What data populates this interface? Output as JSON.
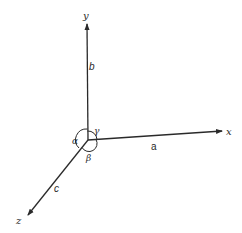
{
  "diagram": {
    "axes": [
      {
        "name": "x",
        "label": "x",
        "edge_label": "a"
      },
      {
        "name": "y",
        "label": "y",
        "edge_label": "b"
      },
      {
        "name": "z",
        "label": "z",
        "edge_label": "c"
      }
    ],
    "angles": [
      {
        "name": "alpha",
        "symbol": "α"
      },
      {
        "name": "beta",
        "symbol": "β"
      },
      {
        "name": "gamma",
        "symbol": "γ"
      }
    ],
    "colors": {
      "line": "#2a2a2a",
      "background": "#ffffff"
    }
  }
}
